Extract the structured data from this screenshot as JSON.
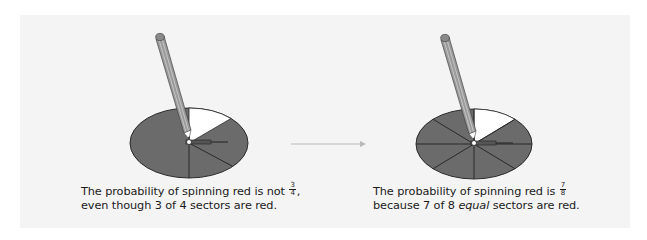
{
  "figure": {
    "left_panel": {
      "spinner": {
        "sectors_total": 4,
        "red_sectors": 3,
        "white_sectors": 1,
        "sectors_equal": false
      },
      "caption": {
        "line1_prefix": "The probability of spinning red is not",
        "fraction_numerator": "3",
        "fraction_denominator": "4",
        "line1_suffix": ",",
        "line2": "even though 3 of 4 sectors are red."
      }
    },
    "arrow": {
      "direction": "right"
    },
    "right_panel": {
      "spinner": {
        "sectors_total": 8,
        "red_sectors": 7,
        "white_sectors": 1,
        "sectors_equal": true
      },
      "caption": {
        "line1_prefix": "The probability of spinning red is",
        "fraction_numerator": "7",
        "fraction_denominator": "8",
        "line2_prefix": "because 7 of 8",
        "line2_emphasis": "equal",
        "line2_suffix": "sectors are red."
      }
    },
    "colors": {
      "background": "#ffffff",
      "panel": "#f4f4f4",
      "red_sector": "#6b6b6b",
      "white_sector": "#ffffff",
      "outline": "#2a2a2a",
      "arrow": "#b8b8b8",
      "pencil_body": "#9a9a9a",
      "text": "#1a1a1a"
    }
  }
}
